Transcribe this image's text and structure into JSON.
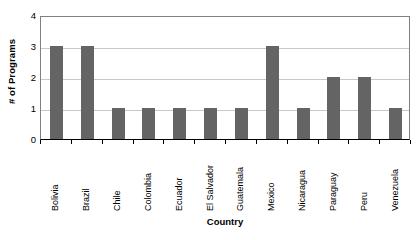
{
  "chart_data": {
    "type": "bar",
    "title": "",
    "xlabel": "Country",
    "ylabel": "# of Programs",
    "categories": [
      "Bolivia",
      "Brazil",
      "Chile",
      "Colombia",
      "Ecuador",
      "El Salvador",
      "Guatemala",
      "Mexico",
      "Nicaragua",
      "Paraguay",
      "Peru",
      "Venezuela"
    ],
    "values": [
      3,
      3,
      1,
      1,
      1,
      1,
      1,
      3,
      1,
      2,
      2,
      1
    ],
    "ylim": [
      0,
      4
    ],
    "yticks": [
      0,
      1,
      2,
      3,
      4
    ],
    "ytick_labels": [
      "0",
      "1",
      "2",
      "3",
      "4"
    ],
    "grid": true,
    "grid_axis": "y",
    "legend": false,
    "bar_color": "#646464",
    "grid_color": "#c8c8c8",
    "axis_color": "#000000",
    "plot_border_color": "#808080",
    "background_color": "#ffffff"
  }
}
